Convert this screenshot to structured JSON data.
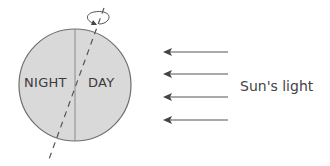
{
  "diagram": {
    "earth": {
      "left_label": "NIGHT",
      "right_label": "DAY",
      "fill_color": "#d9d9d9",
      "outline_color": "#6e6e6e"
    },
    "axis": {
      "style": "dashed",
      "rotation_indicator": "rotation-arrow"
    },
    "light": {
      "label": "Sun's light",
      "arrow_count": 4,
      "arrow_color": "#555555"
    }
  }
}
